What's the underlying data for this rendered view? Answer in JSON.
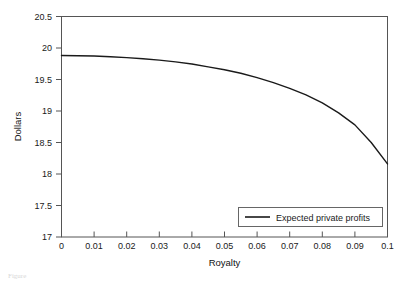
{
  "chart_data": {
    "type": "line",
    "title": "",
    "xlabel": "Royalty",
    "ylabel": "Dollars",
    "xlim": [
      0,
      0.1
    ],
    "ylim": [
      17,
      20.5
    ],
    "grid": false,
    "legend_position": "bottom-right",
    "x_tick_labels": [
      "0",
      "0.01",
      "0.02",
      "0.03",
      "0.04",
      "0.05",
      "0.06",
      "0.07",
      "0.08",
      "0.09",
      "0.1"
    ],
    "x_ticks": [
      0,
      0.01,
      0.02,
      0.03,
      0.04,
      0.05,
      0.06,
      0.07,
      0.08,
      0.09,
      0.1
    ],
    "y_tick_labels": [
      "20.5",
      "20",
      "19.5",
      "19",
      "18.5",
      "18",
      "17.5",
      "17"
    ],
    "y_ticks": [
      20.5,
      20,
      19.5,
      19,
      18.5,
      18,
      17.5,
      17
    ],
    "series": [
      {
        "name": "Expected private profits",
        "color": "#1a1a1a",
        "x": [
          0,
          0.005,
          0.01,
          0.015,
          0.02,
          0.025,
          0.03,
          0.035,
          0.04,
          0.045,
          0.05,
          0.055,
          0.06,
          0.065,
          0.07,
          0.075,
          0.08,
          0.085,
          0.09,
          0.095,
          0.1
        ],
        "values": [
          19.88,
          19.878,
          19.872,
          19.862,
          19.848,
          19.83,
          19.808,
          19.78,
          19.745,
          19.7,
          19.655,
          19.6,
          19.53,
          19.45,
          19.36,
          19.255,
          19.13,
          18.97,
          18.78,
          18.5,
          18.16
        ]
      }
    ]
  },
  "legend": {
    "entries": [
      {
        "label": "Expected private profits"
      }
    ]
  },
  "axes": {
    "x_title": "Royalty",
    "y_title": "Dollars"
  },
  "caption": {
    "text": "Figure"
  }
}
